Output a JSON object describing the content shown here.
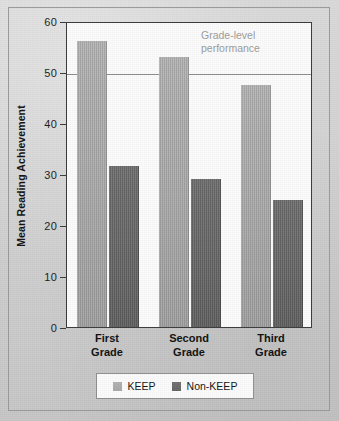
{
  "chart_data": {
    "type": "bar",
    "title": "",
    "xlabel": "",
    "ylabel": "Mean Reading Achievement",
    "ylim": [
      0,
      60
    ],
    "yticks": [
      0,
      10,
      20,
      30,
      40,
      50,
      60
    ],
    "ytick_labels": [
      "0",
      "10",
      "20",
      "30",
      "40",
      "50",
      "60"
    ],
    "grid": "single horizontal reference line at y = 50",
    "legend_position": "bottom-center",
    "categories": [
      "First\nGrade",
      "Second\nGrade",
      "Third\nGrade"
    ],
    "category_labels": [
      "First Grade",
      "Second Grade",
      "Third Grade"
    ],
    "series": [
      {
        "name": "KEEP",
        "color": "#a8a8a8",
        "values": [
          56,
          53,
          47.5
        ]
      },
      {
        "name": "Non-KEEP",
        "color": "#666666",
        "values": [
          31.5,
          29,
          25
        ]
      }
    ],
    "annotations": [
      {
        "text": "Grade-level\nperformance",
        "line1": "Grade-level",
        "line2": "performance",
        "y_value": 50,
        "color": "#9b9b9b"
      }
    ]
  },
  "axis": {
    "y_title": "Mean Reading Achievement",
    "y_ticks": [
      {
        "value": 60,
        "label": "60"
      },
      {
        "value": 50,
        "label": "50"
      },
      {
        "value": 40,
        "label": "40"
      },
      {
        "value": 30,
        "label": "30"
      },
      {
        "value": 20,
        "label": "20"
      },
      {
        "value": 10,
        "label": "10"
      },
      {
        "value": 0,
        "label": "0"
      }
    ]
  },
  "groups": [
    {
      "line1": "First",
      "line2": "Grade",
      "keep": 56,
      "nonkeep": 31.5
    },
    {
      "line1": "Second",
      "line2": "Grade",
      "keep": 53,
      "nonkeep": 29
    },
    {
      "line1": "Third",
      "line2": "Grade",
      "keep": 47.5,
      "nonkeep": 25
    }
  ],
  "legend": {
    "items": [
      {
        "label": "KEEP",
        "color": "#a8a8a8"
      },
      {
        "label": "Non-KEEP",
        "color": "#666666"
      }
    ]
  },
  "reference": {
    "line1": "Grade-level",
    "line2": "performance",
    "value": 50
  },
  "colors": {
    "keep": "#a8a8a8",
    "nonkeep": "#666666",
    "background": "#cfcfcf",
    "plot_background": "#fbfbfb",
    "axis": "#3a3a3a",
    "annotation": "#9b9b9b"
  }
}
